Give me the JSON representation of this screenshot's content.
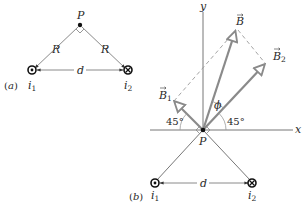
{
  "figure": {
    "colors": {
      "line": "#7a7a7a",
      "vector": "#8a8a8a",
      "text": "#2a2a2a",
      "point": "#111111"
    },
    "panel_a": {
      "label": "(a)",
      "point_label": "P",
      "side_label_left": "R",
      "side_label_right": "R",
      "separation_label": "d",
      "wire1": {
        "symbol": "dot-out-of-page",
        "label_main": "i",
        "label_sub": "1"
      },
      "wire2": {
        "symbol": "cross-into-page",
        "label_main": "i",
        "label_sub": "2"
      }
    },
    "panel_b": {
      "label": "(b)",
      "point_label": "P",
      "axis_x_label": "x",
      "axis_y_label": "y",
      "vector_B_label": "B",
      "vector_B1_label_main": "B",
      "vector_B1_label_sub": "1",
      "vector_B2_label_main": "B",
      "vector_B2_label_sub": "2",
      "angle_phi_label": "ϕ",
      "angle_left_label": "45°",
      "angle_right_label": "45°",
      "separation_label": "d",
      "wire1": {
        "symbol": "dot-out-of-page",
        "label_main": "i",
        "label_sub": "1"
      },
      "wire2": {
        "symbol": "cross-into-page",
        "label_main": "i",
        "label_sub": "2"
      }
    }
  }
}
